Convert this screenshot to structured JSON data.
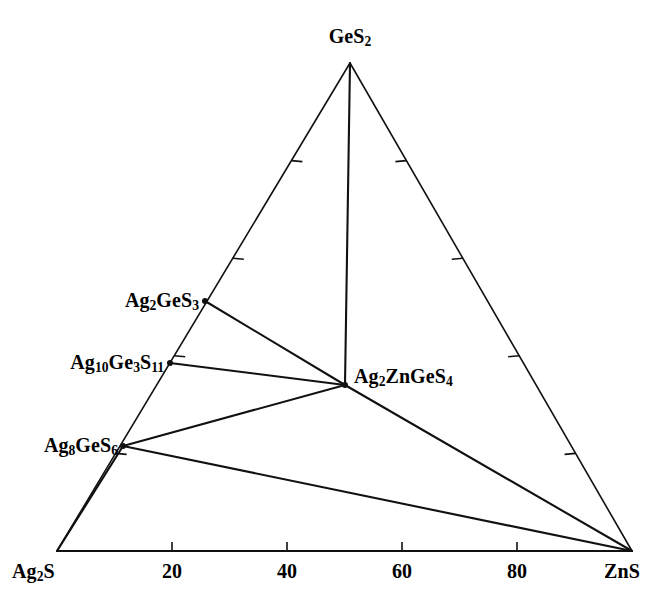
{
  "figure": {
    "type": "ternary-phase-diagram",
    "background_color": "#ffffff",
    "line_color": "#111111"
  },
  "chart_data": {
    "type": "scatter",
    "title": "",
    "xlabel": "",
    "ylabel": "",
    "system": "Ag2S - GeS2 - ZnS",
    "grid": false,
    "legend": "none",
    "corners": [
      {
        "id": "GeS2",
        "label_html": "GeS<sub>2</sub>",
        "label_text": "GeS2",
        "position": "top",
        "composition": {
          "Ag2S": 0,
          "GeS2": 100,
          "ZnS": 0
        },
        "px": {
          "x": 350,
          "y": 63
        }
      },
      {
        "id": "Ag2S",
        "label_html": "Ag<sub>2</sub>S",
        "label_text": "Ag2S",
        "position": "bottom-left",
        "composition": {
          "Ag2S": 100,
          "GeS2": 0,
          "ZnS": 0
        },
        "px": {
          "x": 57,
          "y": 551
        }
      },
      {
        "id": "ZnS",
        "label_html": "ZnS",
        "label_text": "ZnS",
        "position": "bottom-right",
        "composition": {
          "Ag2S": 0,
          "GeS2": 0,
          "ZnS": 100
        },
        "px": {
          "x": 632,
          "y": 551
        }
      }
    ],
    "compounds": [
      {
        "id": "Ag2GeS3",
        "label_html": "Ag<sub>2</sub>GeS<sub>3</sub>",
        "label_text": "Ag2GeS3",
        "on_edge": "Ag2S-GeS2",
        "px": {
          "x": 205,
          "y": 301
        },
        "label_px": {
          "x": 199,
          "y": 301
        },
        "label_anchor": "right"
      },
      {
        "id": "Ag10Ge3S11",
        "label_html": "Ag<sub>10</sub>Ge<sub>3</sub>S<sub>11</sub>",
        "label_text": "Ag10Ge3S11",
        "on_edge": "Ag2S-GeS2",
        "px": {
          "x": 170,
          "y": 363
        },
        "label_px": {
          "x": 164,
          "y": 363
        },
        "label_anchor": "right"
      },
      {
        "id": "Ag8GeS6",
        "label_html": "Ag<sub>8</sub>GeS<sub>6</sub>",
        "label_text": "Ag8GeS6",
        "on_edge": "Ag2S-GeS2",
        "px": {
          "x": 123,
          "y": 446
        },
        "label_px": {
          "x": 118,
          "y": 446
        },
        "label_anchor": "right"
      },
      {
        "id": "Ag2ZnGeS4",
        "label_html": "Ag<sub>2</sub>ZnGeS<sub>4</sub>",
        "label_text": "Ag2ZnGeS4",
        "on_edge": "interior",
        "px": {
          "x": 345,
          "y": 385
        },
        "label_px": {
          "x": 354,
          "y": 377
        },
        "label_anchor": "left"
      }
    ],
    "tie_lines": [
      {
        "from": "GeS2",
        "to": "Ag2ZnGeS4"
      },
      {
        "from": "Ag2GeS3",
        "to": "Ag2ZnGeS4"
      },
      {
        "from": "Ag10Ge3S11",
        "to": "Ag2ZnGeS4"
      },
      {
        "from": "Ag8GeS6",
        "to": "Ag2ZnGeS4"
      },
      {
        "from": "Ag2ZnGeS4",
        "to": "ZnS"
      },
      {
        "from": "Ag8GeS6",
        "to": "ZnS"
      },
      {
        "from": "Ag2S",
        "to": "Ag8GeS6"
      },
      {
        "from": "Ag2S",
        "to": "ZnS"
      }
    ],
    "axis": {
      "bottom": {
        "from_label": "Ag2S",
        "to_label": "ZnS",
        "tick_values": [
          20,
          40,
          60,
          80
        ],
        "tick_labels": [
          "20",
          "40",
          "60",
          "80"
        ],
        "range": [
          0,
          100
        ],
        "units": "mol %"
      },
      "left": {
        "tick_values": [
          20,
          40,
          60,
          80
        ],
        "labels_shown": false
      },
      "right": {
        "tick_values": [
          20,
          40,
          60,
          80
        ],
        "labels_shown": false
      }
    }
  },
  "labels": {
    "apex": "GeS2",
    "bottom_left": "Ag2S",
    "bottom_right": "ZnS"
  }
}
